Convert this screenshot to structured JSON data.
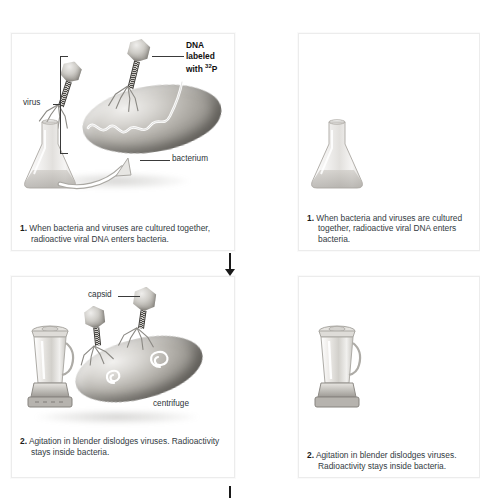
{
  "figure": {
    "background_color": "#ffffff",
    "panel_border_color": "#ececec",
    "text_color": "#333b42",
    "arrow_color": "#1a1a1a"
  },
  "panels": [
    {
      "id": "step-1",
      "number": "1.",
      "caption": "When bacteria and viruses are cultured together, radioactive viral DNA enters bacteria.",
      "labels": [
        {
          "name": "dna-label",
          "text_lines": [
            "DNA",
            "labeled",
            "with ",
            "32",
            "P"
          ],
          "text": "DNA labeled with 32P",
          "bold": true
        },
        {
          "name": "virus-label",
          "text": "virus",
          "bold": false
        },
        {
          "name": "bacterium-label",
          "text": "bacterium",
          "bold": false
        }
      ],
      "illustrations": [
        "erlenmeyer-flask",
        "curved-arrow",
        "bacterium-rod",
        "bacteriophage",
        "bacteriophage",
        "viral-dna-strand"
      ]
    },
    {
      "id": "step-2",
      "number": "2.",
      "caption": "Agitation in blender dislodges viruses. Radioactivity stays inside bacteria.",
      "labels": [
        {
          "name": "capsid-label",
          "text": "capsid",
          "bold": false
        },
        {
          "name": "centrifuge-label",
          "text": "centrifuge",
          "bold": false
        }
      ],
      "illustrations": [
        "blender",
        "bacterium-rod",
        "bacteriophage",
        "bacteriophage",
        "dna-spiral",
        "dna-spiral"
      ]
    }
  ],
  "panels_right_cropped": [
    {
      "id": "step-1-repeat",
      "number": "1.",
      "caption": "When bacteria and viruses are cultured together, radioactive viral DNA enters bacteria."
    },
    {
      "id": "step-2-repeat",
      "number": "2.",
      "caption": "Agitation in blender dislodges viruses. Radioactivity stays inside bacteria."
    }
  ],
  "arrows": [
    {
      "name": "flow-arrow-1-to-2",
      "direction": "down"
    },
    {
      "name": "flow-arrow-2-to-3",
      "direction": "down"
    }
  ]
}
